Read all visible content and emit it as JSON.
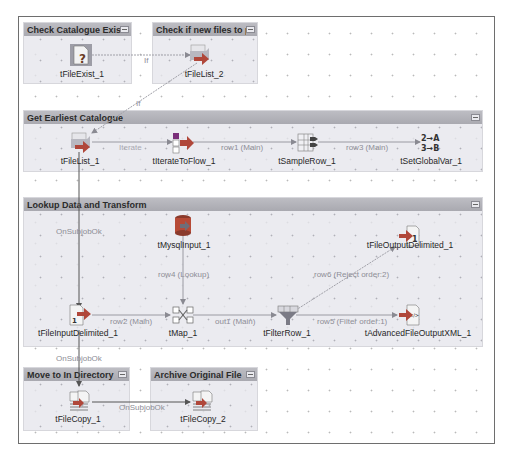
{
  "subjobs": [
    {
      "id": "check-catalogue-exists",
      "title": "Check Catalogue Exists"
    },
    {
      "id": "check-new-files",
      "title": "Check if new files to pr..."
    },
    {
      "id": "get-earliest-catalogue",
      "title": "Get Earliest Catalogue"
    },
    {
      "id": "lookup-data-transform",
      "title": "Lookup Data and Transform"
    },
    {
      "id": "move-to-in-directory",
      "title": "Move to In Directory"
    },
    {
      "id": "archive-original-file",
      "title": "Archive Original File"
    }
  ],
  "components": {
    "tFileExist_1": "tFileExist_1",
    "tFileList_2": "tFileList_2",
    "tFileList_1": "tFileList_1",
    "tIterateToFlow_1": "tIterateToFlow_1",
    "tSampleRow_1": "tSampleRow_1",
    "tSetGlobalVar_1": "tSetGlobalVar_1",
    "tMysqlInput_1": "tMysqlInput_1",
    "tFileOutputDelimited_1": "tFileOutputDelimited_1",
    "tFileInputDelimited_1": "tFileInputDelimited_1",
    "tMap_1": "tMap_1",
    "tFilterRow_1": "tFilterRow_1",
    "tAdvancedFileOutputXML_1": "tAdvancedFileOutputXML_1",
    "tFileCopy_1": "tFileCopy_1",
    "tFileCopy_2": "tFileCopy_2"
  },
  "links": {
    "if_1": "If",
    "if_2": "If",
    "iterate": "Iterate",
    "row1": "row1 (Main)",
    "row3": "row3 (Main)",
    "onsubjobok_1": "OnSubjobOk",
    "row4": "row4 (Lookup)",
    "row6": "row6 (Reject order:2)",
    "row2": "row2 (Main)",
    "out1": "out1 (Main)",
    "row5": "row5 (Filter order:1)",
    "onsubjobok_2": "OnSubjobOk",
    "onsubjobok_3": "OnSubjobOk"
  },
  "colors": {
    "subjob_header": "#b4b4ba",
    "subjob_body": "#e8e8ee",
    "link_main": "#8c8c94",
    "trigger_if": "#a8a8b0",
    "subjob_ok": "#555555"
  }
}
